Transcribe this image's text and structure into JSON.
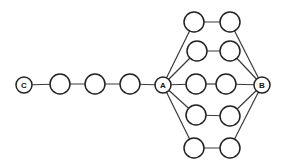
{
  "diagram": {
    "labels": {
      "C": "C",
      "A": "A",
      "B": "B"
    },
    "nodes": {
      "C": {
        "x": 24,
        "y": 85,
        "r": 8
      },
      "p1": {
        "x": 60,
        "y": 84,
        "r": 10
      },
      "p2": {
        "x": 95,
        "y": 84,
        "r": 10
      },
      "p3": {
        "x": 130,
        "y": 84,
        "r": 10
      },
      "A": {
        "x": 163,
        "y": 85,
        "r": 8
      },
      "B": {
        "x": 262,
        "y": 85,
        "r": 8
      },
      "r1a": {
        "x": 194,
        "y": 22,
        "r": 10
      },
      "r1b": {
        "x": 230,
        "y": 22,
        "r": 10
      },
      "r2a": {
        "x": 197,
        "y": 51,
        "r": 10
      },
      "r2b": {
        "x": 230,
        "y": 51,
        "r": 10
      },
      "r3a": {
        "x": 196,
        "y": 84,
        "r": 10
      },
      "r3b": {
        "x": 226,
        "y": 84,
        "r": 10
      },
      "r4a": {
        "x": 196,
        "y": 115,
        "r": 10
      },
      "r4b": {
        "x": 230,
        "y": 116,
        "r": 10
      },
      "r5a": {
        "x": 194,
        "y": 148,
        "r": 10
      },
      "r5b": {
        "x": 230,
        "y": 148,
        "r": 10
      }
    },
    "edges": [
      [
        "C",
        "p1"
      ],
      [
        "p1",
        "p2"
      ],
      [
        "p2",
        "p3"
      ],
      [
        "p3",
        "A"
      ],
      [
        "A",
        "r1a"
      ],
      [
        "r1a",
        "r1b"
      ],
      [
        "r1b",
        "B"
      ],
      [
        "A",
        "r2a"
      ],
      [
        "r2a",
        "r2b"
      ],
      [
        "r2b",
        "B"
      ],
      [
        "A",
        "r3a"
      ],
      [
        "r3a",
        "r3b"
      ],
      [
        "r3b",
        "B"
      ],
      [
        "A",
        "r4a"
      ],
      [
        "r4a",
        "r4b"
      ],
      [
        "r4b",
        "B"
      ],
      [
        "A",
        "r5a"
      ],
      [
        "r5a",
        "r5b"
      ],
      [
        "r5b",
        "B"
      ]
    ]
  }
}
